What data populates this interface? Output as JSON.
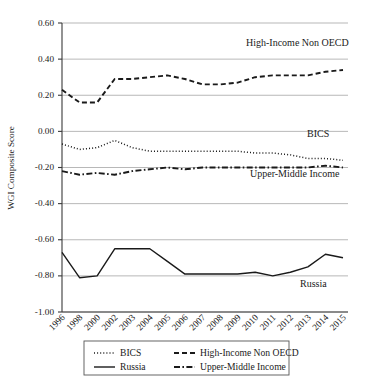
{
  "chart_data": {
    "type": "line",
    "title": "",
    "xlabel": "",
    "ylabel": "WGI Composite Score",
    "ylim": [
      -1.0,
      0.6
    ],
    "ytick_labels": [
      "0.60",
      "0.40",
      "0.20",
      "0.00",
      "-0.20",
      "-0.40",
      "-0.60",
      "-0.80",
      "-1.00"
    ],
    "ytick_values": [
      0.6,
      0.4,
      0.2,
      0.0,
      -0.2,
      -0.4,
      -0.6,
      -0.8,
      -1.0
    ],
    "grid": "horizontal",
    "legend_position": "below-axes",
    "categories": [
      "1996",
      "1998",
      "2000",
      "2002",
      "2003",
      "2004",
      "2005",
      "2006",
      "2007",
      "2008",
      "2009",
      "2010",
      "2011",
      "2012",
      "2013",
      "2014",
      "2015"
    ],
    "series": [
      {
        "name": "BICS",
        "style": "dotted",
        "values": [
          -0.07,
          -0.1,
          -0.09,
          -0.05,
          -0.09,
          -0.11,
          -0.11,
          -0.11,
          -0.11,
          -0.11,
          -0.11,
          -0.12,
          -0.12,
          -0.13,
          -0.15,
          -0.15,
          -0.16
        ]
      },
      {
        "name": "High-Income Non OECD",
        "style": "dashed",
        "values": [
          0.23,
          0.16,
          0.16,
          0.29,
          0.29,
          0.3,
          0.31,
          0.29,
          0.26,
          0.26,
          0.27,
          0.3,
          0.31,
          0.31,
          0.31,
          0.33,
          0.34
        ]
      },
      {
        "name": "Russia",
        "style": "solid",
        "values": [
          -0.67,
          -0.81,
          -0.8,
          -0.65,
          -0.65,
          -0.65,
          -0.72,
          -0.79,
          -0.79,
          -0.79,
          -0.79,
          -0.78,
          -0.8,
          -0.78,
          -0.75,
          -0.68,
          -0.7
        ]
      },
      {
        "name": "Upper-Middle Income",
        "style": "dashdot",
        "values": [
          -0.22,
          -0.24,
          -0.23,
          -0.24,
          -0.22,
          -0.21,
          -0.2,
          -0.21,
          -0.2,
          -0.2,
          -0.2,
          -0.2,
          -0.2,
          -0.2,
          -0.2,
          -0.19,
          -0.2
        ]
      }
    ],
    "annotations": [
      {
        "text": "High-Income Non OECD",
        "x_px": 246,
        "y_px": 46
      },
      {
        "text": "BICS",
        "x_px": 307,
        "y_px": 137
      },
      {
        "text": "Upper-Middle Income",
        "x_px": 250,
        "y_px": 177
      },
      {
        "text": "Russia",
        "x_px": 300,
        "y_px": 287
      }
    ],
    "legend": [
      {
        "label": "BICS",
        "style": "dotted"
      },
      {
        "label": "High-Income Non OECD",
        "style": "dashed"
      },
      {
        "label": "Russia",
        "style": "solid"
      },
      {
        "label": "Upper-Middle Income",
        "style": "dashdot"
      }
    ],
    "colors": {
      "line": "#1a1a1a",
      "grid": "#9a9a9a",
      "axis": "#3a3a3a",
      "background": "#ffffff"
    }
  }
}
